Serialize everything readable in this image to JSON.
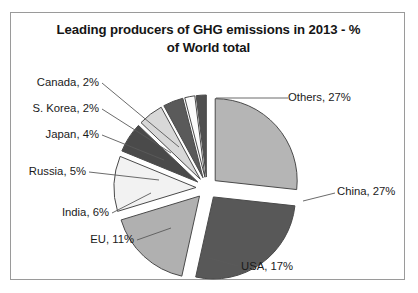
{
  "chart": {
    "title_line1": "Leading producers of GHG emissions in 2013 - %",
    "title_line2": "of World total",
    "frame_border_color": "#9a9a9a"
  },
  "chart_data": {
    "type": "pie",
    "title": "Leading producers of GHG emissions in 2013 - % of World total",
    "subtitle": "",
    "xlabel": "",
    "ylabel": "",
    "exploded": true,
    "legend_position": "none",
    "labels_outside": true,
    "unit": "% of World total",
    "categories": [
      "Others",
      "China",
      "USA",
      "EU",
      "India",
      "Russia",
      "Japan",
      "S. Korea",
      "Canada"
    ],
    "values": [
      27,
      27,
      17,
      11,
      6,
      5,
      4,
      2,
      2
    ],
    "colors": [
      "#b5b5b5",
      "#585858",
      "#b0b0b0",
      "#f2f2f2",
      "#4a4a4a",
      "#d8d8d8",
      "#5a5a5a",
      "#fbfbfb",
      "#4f4f4f"
    ],
    "slices": [
      {
        "name": "Others",
        "value": 27,
        "label": "Others, 27%",
        "color": "#b5b5b5"
      },
      {
        "name": "China",
        "value": 27,
        "label": "China, 27%",
        "color": "#585858"
      },
      {
        "name": "USA",
        "value": 17,
        "label": "USA, 17%",
        "color": "#b0b0b0"
      },
      {
        "name": "EU",
        "value": 11,
        "label": "EU, 11%",
        "color": "#f2f2f2"
      },
      {
        "name": "India",
        "value": 6,
        "label": "India, 6%",
        "color": "#4a4a4a"
      },
      {
        "name": "Russia",
        "value": 5,
        "label": "Russia, 5%",
        "color": "#d8d8d8"
      },
      {
        "name": "Japan",
        "value": 4,
        "label": "Japan, 4%",
        "color": "#5a5a5a"
      },
      {
        "name": "S. Korea",
        "value": 2,
        "label": "S. Korea, 2%",
        "color": "#fbfbfb"
      },
      {
        "name": "Canada",
        "value": 2,
        "label": "Canada, 2%",
        "color": "#4f4f4f"
      }
    ]
  },
  "labels": {
    "others": "Others, 27%",
    "china": "China, 27%",
    "usa": "USA, 17%",
    "eu": "EU, 11%",
    "india": "India, 6%",
    "russia": "Russia, 5%",
    "japan": "Japan, 4%",
    "skorea": "S. Korea, 2%",
    "canada": "Canada, 2%"
  }
}
